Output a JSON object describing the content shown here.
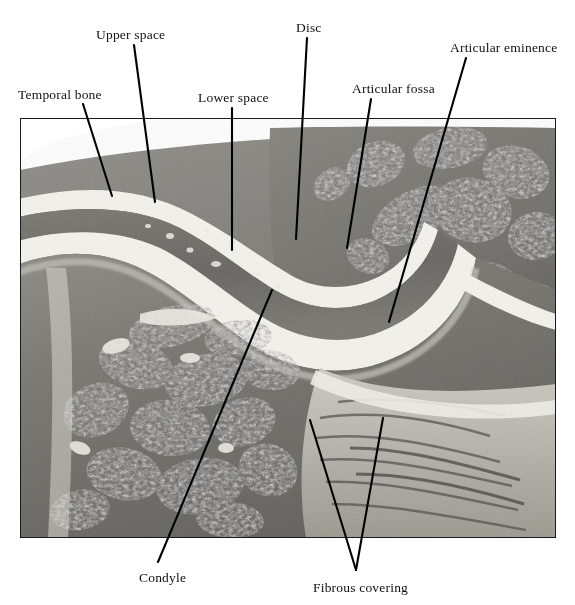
{
  "figure": {
    "kind": "histology-micrograph",
    "background_color": "#ffffff",
    "leader_color": "#000000",
    "text_color": "#111111"
  },
  "micrograph": {
    "name": "tmj-histology-photomicrograph",
    "x": 20,
    "y": 118,
    "width": 536,
    "height": 420,
    "palette": {
      "tissue_mid": "#7d7d7a",
      "tissue_dark": "#4a4a47",
      "tissue_light": "#a9a9a4",
      "joint_space": "#f4f2ec",
      "marrow_dark": "#3b3b38",
      "bone_pale": "#c9c7c0",
      "border": "#000000"
    }
  },
  "labels": [
    {
      "id": "temporal-bone",
      "text": "Temporal bone",
      "x": 18,
      "y": 88,
      "leader": {
        "x1": 83,
        "y1": 104,
        "x2": 112,
        "y2": 196
      }
    },
    {
      "id": "upper-space",
      "text": "Upper space",
      "x": 96,
      "y": 28,
      "leader": {
        "x1": 134,
        "y1": 45,
        "x2": 155,
        "y2": 202
      }
    },
    {
      "id": "lower-space",
      "text": "Lower space",
      "x": 198,
      "y": 91,
      "leader": {
        "x1": 232,
        "y1": 108,
        "x2": 232,
        "y2": 250
      }
    },
    {
      "id": "disc",
      "text": "Disc",
      "x": 296,
      "y": 21,
      "leader": {
        "x1": 307,
        "y1": 38,
        "x2": 296,
        "y2": 239
      }
    },
    {
      "id": "articular-fossa",
      "text": "Articular fossa",
      "x": 352,
      "y": 82,
      "leader": {
        "x1": 371,
        "y1": 99,
        "x2": 347,
        "y2": 248
      }
    },
    {
      "id": "articular-eminence",
      "text": "Articular eminence",
      "x": 450,
      "y": 41,
      "leader": {
        "x1": 466,
        "y1": 58,
        "x2": 389,
        "y2": 322
      }
    },
    {
      "id": "condyle",
      "text": "Condyle",
      "x": 139,
      "y": 571,
      "leader": {
        "x1": 158,
        "y1": 562,
        "x2": 272,
        "y2": 290
      }
    },
    {
      "id": "fibrous-covering",
      "text": "Fibrous covering",
      "x": 313,
      "y": 581,
      "leaders": [
        {
          "x1": 356,
          "y1": 570,
          "x2": 310,
          "y2": 420
        },
        {
          "x1": 356,
          "y1": 570,
          "x2": 383,
          "y2": 418
        }
      ]
    }
  ]
}
